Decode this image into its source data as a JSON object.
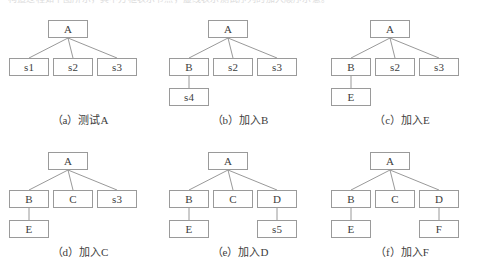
{
  "figure": {
    "top_cut_text": "构造过程如下图所示，其中方框表示节点，虚线表示测试序列的加入顺序示意。",
    "node_width": 40,
    "node_height": 18,
    "edge_color": "#8d8d8d",
    "border_color": "#9a9a9a",
    "text_color": "#3d3d3d",
    "background": "#ffffff",
    "panels": [
      {
        "id": "a",
        "caption": "（a）测试A",
        "nodes": [
          {
            "name": "root-a",
            "label": "A",
            "x": 48,
            "y": 12
          },
          {
            "name": "child-s1",
            "label": "s1",
            "x": 9,
            "y": 50
          },
          {
            "name": "child-s2",
            "label": "s2",
            "x": 53,
            "y": 50
          },
          {
            "name": "child-s3",
            "label": "s3",
            "x": 97,
            "y": 50
          }
        ],
        "edges": [
          {
            "x1": 68,
            "y1": 30,
            "x2": 29,
            "y2": 50
          },
          {
            "x1": 68,
            "y1": 30,
            "x2": 73,
            "y2": 50
          },
          {
            "x1": 68,
            "y1": 30,
            "x2": 117,
            "y2": 50
          }
        ]
      },
      {
        "id": "b",
        "caption": "（b）加入B",
        "nodes": [
          {
            "name": "root-a",
            "label": "A",
            "x": 48,
            "y": 12
          },
          {
            "name": "child-b",
            "label": "B",
            "x": 9,
            "y": 50
          },
          {
            "name": "child-s2",
            "label": "s2",
            "x": 53,
            "y": 50
          },
          {
            "name": "child-s3",
            "label": "s3",
            "x": 97,
            "y": 50
          },
          {
            "name": "child-s4",
            "label": "s4",
            "x": 9,
            "y": 80
          }
        ],
        "edges": [
          {
            "x1": 68,
            "y1": 30,
            "x2": 29,
            "y2": 50
          },
          {
            "x1": 68,
            "y1": 30,
            "x2": 73,
            "y2": 50
          },
          {
            "x1": 68,
            "y1": 30,
            "x2": 117,
            "y2": 50
          },
          {
            "x1": 29,
            "y1": 68,
            "x2": 29,
            "y2": 80
          }
        ]
      },
      {
        "id": "c",
        "caption": "（c）加入E",
        "nodes": [
          {
            "name": "root-a",
            "label": "A",
            "x": 48,
            "y": 12
          },
          {
            "name": "child-b",
            "label": "B",
            "x": 9,
            "y": 50
          },
          {
            "name": "child-s2",
            "label": "s2",
            "x": 53,
            "y": 50
          },
          {
            "name": "child-s3",
            "label": "s3",
            "x": 97,
            "y": 50
          },
          {
            "name": "child-e",
            "label": "E",
            "x": 9,
            "y": 80
          }
        ],
        "edges": [
          {
            "x1": 68,
            "y1": 30,
            "x2": 29,
            "y2": 50
          },
          {
            "x1": 68,
            "y1": 30,
            "x2": 73,
            "y2": 50
          },
          {
            "x1": 68,
            "y1": 30,
            "x2": 117,
            "y2": 50
          },
          {
            "x1": 29,
            "y1": 68,
            "x2": 29,
            "y2": 80
          }
        ]
      },
      {
        "id": "d",
        "caption": "（d）加入C",
        "nodes": [
          {
            "name": "root-a",
            "label": "A",
            "x": 48,
            "y": 12
          },
          {
            "name": "child-b",
            "label": "B",
            "x": 9,
            "y": 50
          },
          {
            "name": "child-c",
            "label": "C",
            "x": 53,
            "y": 50
          },
          {
            "name": "child-s3",
            "label": "s3",
            "x": 97,
            "y": 50
          },
          {
            "name": "child-e",
            "label": "E",
            "x": 9,
            "y": 80
          }
        ],
        "edges": [
          {
            "x1": 68,
            "y1": 30,
            "x2": 29,
            "y2": 50
          },
          {
            "x1": 68,
            "y1": 30,
            "x2": 73,
            "y2": 50
          },
          {
            "x1": 68,
            "y1": 30,
            "x2": 117,
            "y2": 50
          },
          {
            "x1": 29,
            "y1": 68,
            "x2": 29,
            "y2": 80
          }
        ]
      },
      {
        "id": "e",
        "caption": "（e）加入D",
        "nodes": [
          {
            "name": "root-a",
            "label": "A",
            "x": 48,
            "y": 12
          },
          {
            "name": "child-b",
            "label": "B",
            "x": 9,
            "y": 50
          },
          {
            "name": "child-c",
            "label": "C",
            "x": 53,
            "y": 50
          },
          {
            "name": "child-d",
            "label": "D",
            "x": 97,
            "y": 50
          },
          {
            "name": "child-e",
            "label": "E",
            "x": 9,
            "y": 80
          },
          {
            "name": "child-s5",
            "label": "s5",
            "x": 97,
            "y": 80
          }
        ],
        "edges": [
          {
            "x1": 68,
            "y1": 30,
            "x2": 29,
            "y2": 50
          },
          {
            "x1": 68,
            "y1": 30,
            "x2": 73,
            "y2": 50
          },
          {
            "x1": 68,
            "y1": 30,
            "x2": 117,
            "y2": 50
          },
          {
            "x1": 29,
            "y1": 68,
            "x2": 29,
            "y2": 80
          },
          {
            "x1": 117,
            "y1": 68,
            "x2": 117,
            "y2": 80
          }
        ]
      },
      {
        "id": "f",
        "caption": "（f）加入F",
        "nodes": [
          {
            "name": "root-a",
            "label": "A",
            "x": 48,
            "y": 12
          },
          {
            "name": "child-b",
            "label": "B",
            "x": 9,
            "y": 50
          },
          {
            "name": "child-c",
            "label": "C",
            "x": 53,
            "y": 50
          },
          {
            "name": "child-d",
            "label": "D",
            "x": 97,
            "y": 50
          },
          {
            "name": "child-e",
            "label": "E",
            "x": 9,
            "y": 80
          },
          {
            "name": "child-f",
            "label": "F",
            "x": 97,
            "y": 80
          }
        ],
        "edges": [
          {
            "x1": 68,
            "y1": 30,
            "x2": 29,
            "y2": 50
          },
          {
            "x1": 68,
            "y1": 30,
            "x2": 73,
            "y2": 50
          },
          {
            "x1": 68,
            "y1": 30,
            "x2": 117,
            "y2": 50
          },
          {
            "x1": 29,
            "y1": 68,
            "x2": 29,
            "y2": 80
          },
          {
            "x1": 117,
            "y1": 68,
            "x2": 117,
            "y2": 80
          }
        ]
      }
    ],
    "panel_positions": [
      {
        "left": 0,
        "top": 8
      },
      {
        "left": 160,
        "top": 8
      },
      {
        "left": 322,
        "top": 8
      },
      {
        "left": 0,
        "top": 140
      },
      {
        "left": 160,
        "top": 140
      },
      {
        "left": 322,
        "top": 140
      }
    ],
    "caption_top": 106
  }
}
